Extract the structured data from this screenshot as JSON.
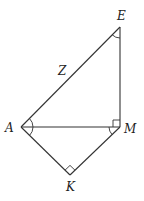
{
  "diagram": {
    "type": "geometry",
    "points": {
      "E": {
        "label": "E",
        "x": 120,
        "y": 27
      },
      "A": {
        "label": "A",
        "x": 21,
        "y": 127
      },
      "M": {
        "label": "M",
        "x": 120,
        "y": 127
      },
      "K": {
        "label": "K",
        "x": 70,
        "y": 175
      }
    },
    "segments": [
      {
        "from": "A",
        "to": "E",
        "label": "Z"
      },
      {
        "from": "E",
        "to": "M",
        "label": ""
      },
      {
        "from": "A",
        "to": "M",
        "label": ""
      },
      {
        "from": "A",
        "to": "K",
        "label": ""
      },
      {
        "from": "K",
        "to": "M",
        "label": ""
      }
    ],
    "angle_marks": [
      {
        "vertex": "E",
        "type": "arc"
      },
      {
        "vertex": "A",
        "between": [
          "E",
          "M"
        ],
        "type": "arc"
      },
      {
        "vertex": "A",
        "between": [
          "M",
          "K"
        ],
        "type": "arc"
      },
      {
        "vertex": "M",
        "between": [
          "A",
          "K"
        ],
        "type": "arc"
      },
      {
        "vertex": "M",
        "between": [
          "A",
          "E"
        ],
        "type": "right-angle"
      },
      {
        "vertex": "K",
        "type": "right-angle"
      }
    ],
    "side_label": "Z",
    "colors": {
      "stroke": "#333333",
      "text": "#222222",
      "background": "#ffffff"
    }
  }
}
